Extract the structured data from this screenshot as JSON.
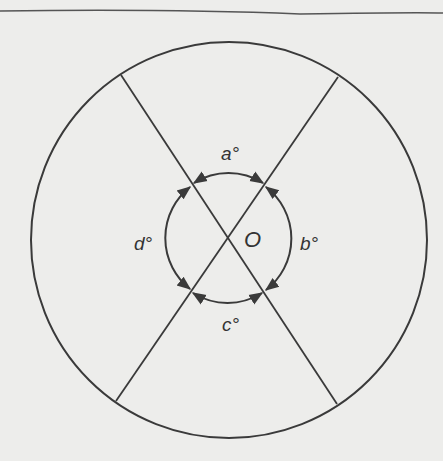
{
  "diagram": {
    "center_label": "O",
    "angles": {
      "top": "a°",
      "right": "b°",
      "bottom": "c°",
      "left": "d°"
    },
    "colors": {
      "background": "#ededeb",
      "stroke": "#3a3a3a"
    }
  }
}
